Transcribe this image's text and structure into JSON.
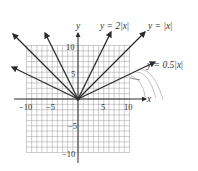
{
  "chart_data": {
    "type": "line",
    "title": "",
    "xlabel": "x",
    "ylabel": "y",
    "xlim": [
      -10,
      10
    ],
    "ylim": [
      -10,
      10
    ],
    "grid": true,
    "grid_step": 1,
    "x_ticks": [
      -10,
      -5,
      5,
      10
    ],
    "y_ticks": [
      10,
      5,
      -5,
      -10
    ],
    "x_tick_labels": [
      "−10",
      "−5",
      "5",
      "10"
    ],
    "y_tick_labels": [
      "10",
      "5",
      "−5",
      "−10"
    ],
    "series": [
      {
        "name": "y = 2|x|",
        "function": "2*abs(x)",
        "points": [
          [
            -6.4,
            12.8
          ],
          [
            0,
            0
          ],
          [
            6.4,
            12.8
          ]
        ]
      },
      {
        "name": "y = |x|",
        "function": "abs(x)",
        "points": [
          [
            -12.6,
            12.6
          ],
          [
            0,
            0
          ],
          [
            13.0,
            13.0
          ]
        ]
      },
      {
        "name": "y = 0.5|x|",
        "function": "0.5*abs(x)",
        "points": [
          [
            -12.8,
            6.4
          ],
          [
            0,
            0
          ],
          [
            15.0,
            7.5
          ]
        ]
      }
    ],
    "annotations": [
      {
        "text": "y = 2|x|",
        "position": "top, above right branch of y=2|x|"
      },
      {
        "text": "y = |x|",
        "position": "top right, above right branch of y=|x|"
      },
      {
        "text": "y = 0.5|x|",
        "position": "right, beside right branch of y=0.5|x|"
      }
    ]
  },
  "labels": {
    "y_axis": "y",
    "x_axis": "x",
    "eq_2x_pre": "y = 2|",
    "eq_2x_var": "x",
    "eq_2x_post": "|",
    "eq_1x_pre": "y = |",
    "eq_1x_var": "x",
    "eq_1x_post": "|",
    "eq_05x_pre": "y = 0.5|",
    "eq_05x_var": "x",
    "eq_05x_post": "|",
    "tick_x_neg10": "−10",
    "tick_x_neg5": "−5",
    "tick_x_5": "5",
    "tick_x_10": "10",
    "tick_y_10": "10",
    "tick_y_5": "5",
    "tick_y_neg5": "−5",
    "tick_y_neg10": "−10"
  },
  "colors": {
    "lines": "#2b2b2b",
    "grid": "#9a9a9a",
    "annotation_strokes": "#b0b0b0"
  }
}
